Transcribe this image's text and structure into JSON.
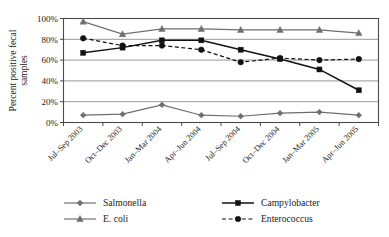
{
  "chart_data": {
    "type": "line",
    "title": "",
    "xlabel": "",
    "ylabel": "Percent positive fecal samples",
    "ylim": [
      0,
      100
    ],
    "ytick_labels": [
      "0%",
      "20%",
      "40%",
      "60%",
      "80%",
      "100%"
    ],
    "ytick_values": [
      0,
      20,
      40,
      60,
      80,
      100
    ],
    "grid": true,
    "legend_position": "bottom",
    "categories": [
      "Jul–Sep 2003",
      "Oct–Dec 2003",
      "Jan–Mar 2004",
      "Apr–Jun 2004",
      "Jul–Sep 2004",
      "Oct–Dec 2004",
      "Jan–Mar 2005",
      "Apr–Jun 2005"
    ],
    "series": [
      {
        "name": "Salmonella",
        "marker": "diamond",
        "line_style": "solid",
        "color": "#6e6e6e",
        "values": [
          7,
          8,
          17,
          7,
          6,
          9,
          10,
          7
        ]
      },
      {
        "name": "Campylobacter",
        "marker": "square",
        "line_style": "solid",
        "color": "#111111",
        "values": [
          67,
          72,
          79,
          79,
          70,
          61,
          51,
          31
        ]
      },
      {
        "name": "E. coli",
        "marker": "triangle",
        "line_style": "solid",
        "color": "#6e6e6e",
        "values": [
          97,
          85,
          90,
          90,
          89,
          89,
          89,
          86
        ]
      },
      {
        "name": "Enterococcus",
        "marker": "circle",
        "line_style": "dashed",
        "color": "#111111",
        "values": [
          81,
          74,
          74,
          70,
          58,
          62,
          60,
          61
        ]
      }
    ]
  },
  "legend": {
    "items": [
      {
        "label": "Salmonella"
      },
      {
        "label": "Campylobacter"
      },
      {
        "label": "E. coli"
      },
      {
        "label": "Enterococcus"
      }
    ]
  },
  "colors": {
    "grid": "#8c8c8c",
    "frame": "#4a4a4a",
    "dark_series": "#111111",
    "gray_series": "#6e6e6e",
    "background": "#ffffff"
  }
}
